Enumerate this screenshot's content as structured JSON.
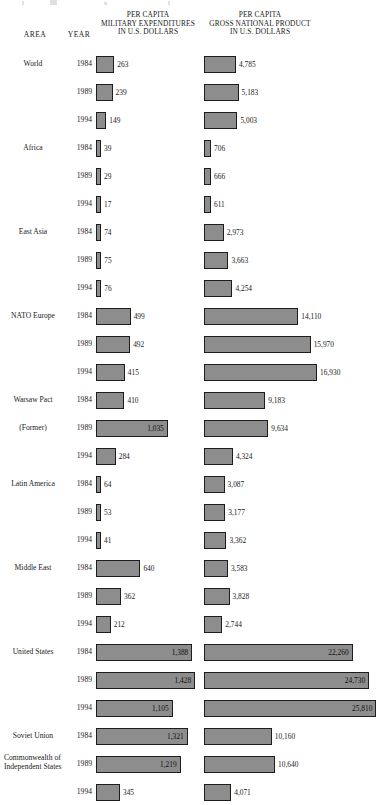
{
  "header": {
    "area": "AREA",
    "year": "YEAR",
    "military": [
      "PER CAPITA",
      "MILITARY EXPENDITURES",
      "IN U.S. DOLLARS"
    ],
    "gnp": [
      "PER CAPITA",
      "GROSS NATIONAL PRODUCT",
      "IN U.S. DOLLARS"
    ]
  },
  "chart_data": {
    "type": "bar",
    "title": "",
    "xlabel": "",
    "ylabel": "",
    "orientation": "horizontal",
    "grid": false,
    "legend": "none",
    "series": [
      {
        "name": "PER CAPITA MILITARY EXPENDITURES IN U.S. DOLLARS",
        "axis_max": 1500,
        "values": [
          263,
          239,
          149,
          39,
          29,
          17,
          74,
          75,
          76,
          499,
          492,
          415,
          410,
          1035,
          284,
          64,
          53,
          41,
          640,
          362,
          212,
          1388,
          1428,
          1105,
          1321,
          1219,
          345
        ],
        "labels": [
          "263",
          "239",
          "149",
          "39",
          "29",
          "17",
          "74",
          "75",
          "76",
          "499",
          "492",
          "415",
          "410",
          "1,035",
          "284",
          "64",
          "53",
          "41",
          "640",
          "362",
          "212",
          "1,388",
          "1,428",
          "1,105",
          "1,321",
          "1,219",
          "345"
        ]
      },
      {
        "name": "PER CAPITA GROSS NATIONAL PRODUCT IN U.S. DOLLARS",
        "axis_max": 26500,
        "values": [
          4785,
          5183,
          5003,
          706,
          666,
          611,
          2973,
          3663,
          4254,
          14110,
          15970,
          16930,
          9183,
          9634,
          4324,
          3087,
          3177,
          3362,
          3583,
          3828,
          2744,
          22260,
          24730,
          25810,
          10160,
          10640,
          4071
        ],
        "labels": [
          "4,785",
          "5,183",
          "5,003",
          "706",
          "666",
          "611",
          "2,973",
          "3,663",
          "4,254",
          "14,110",
          "15,970",
          "16,930",
          "9,183",
          "9,634",
          "4,324",
          "3,087",
          "3,177",
          "3,362",
          "3,583",
          "3,828",
          "2,744",
          "22,260",
          "24,730",
          "25,810",
          "10,160",
          "10,640",
          "4,071"
        ]
      }
    ],
    "categories": [
      "World 1984",
      "World 1989",
      "World 1994",
      "Africa 1984",
      "Africa 1989",
      "Africa 1994",
      "East Asia 1984",
      "East Asia 1989",
      "East Asia 1994",
      "NATO Europe 1984",
      "NATO Europe 1989",
      "NATO Europe 1994",
      "Warsaw Pact (Former) 1984",
      "Warsaw Pact (Former) 1989",
      "Warsaw Pact (Former) 1994",
      "Latin America 1984",
      "Latin America 1989",
      "Latin America 1994",
      "Middle East 1984",
      "Middle East 1989",
      "Middle East 1994",
      "United States 1984",
      "United States 1989",
      "United States 1994",
      "Soviet Union 1984",
      "Commonwealth of Independent States 1989",
      "Commonwealth of Independent States 1994"
    ]
  },
  "rows": [
    {
      "area": "World",
      "area_multiline": false,
      "year": "1984",
      "mil": 263,
      "mil_label": "263",
      "mil_inside": false,
      "gnp": 4785,
      "gnp_label": "4,785",
      "gnp_inside": false
    },
    {
      "area": "",
      "area_multiline": false,
      "year": "1989",
      "mil": 239,
      "mil_label": "239",
      "mil_inside": false,
      "gnp": 5183,
      "gnp_label": "5,183",
      "gnp_inside": false
    },
    {
      "area": "",
      "area_multiline": false,
      "year": "1994",
      "mil": 149,
      "mil_label": "149",
      "mil_inside": false,
      "gnp": 5003,
      "gnp_label": "5,003",
      "gnp_inside": false
    },
    {
      "area": "Africa",
      "area_multiline": false,
      "year": "1984",
      "mil": 39,
      "mil_label": "39",
      "mil_inside": false,
      "gnp": 706,
      "gnp_label": "706",
      "gnp_inside": false
    },
    {
      "area": "",
      "area_multiline": false,
      "year": "1989",
      "mil": 29,
      "mil_label": "29",
      "mil_inside": false,
      "gnp": 666,
      "gnp_label": "666",
      "gnp_inside": false
    },
    {
      "area": "",
      "area_multiline": false,
      "year": "1994",
      "mil": 17,
      "mil_label": "17",
      "mil_inside": false,
      "gnp": 611,
      "gnp_label": "611",
      "gnp_inside": false
    },
    {
      "area": "East Asia",
      "area_multiline": false,
      "year": "1984",
      "mil": 74,
      "mil_label": "74",
      "mil_inside": false,
      "gnp": 2973,
      "gnp_label": "2,973",
      "gnp_inside": false
    },
    {
      "area": "",
      "area_multiline": false,
      "year": "1989",
      "mil": 75,
      "mil_label": "75",
      "mil_inside": false,
      "gnp": 3663,
      "gnp_label": "3,663",
      "gnp_inside": false
    },
    {
      "area": "",
      "area_multiline": false,
      "year": "1994",
      "mil": 76,
      "mil_label": "76",
      "mil_inside": false,
      "gnp": 4254,
      "gnp_label": "4,254",
      "gnp_inside": false
    },
    {
      "area": "NATO Europe",
      "area_multiline": false,
      "year": "1984",
      "mil": 499,
      "mil_label": "499",
      "mil_inside": false,
      "gnp": 14110,
      "gnp_label": "14,110",
      "gnp_inside": false
    },
    {
      "area": "",
      "area_multiline": false,
      "year": "1989",
      "mil": 492,
      "mil_label": "492",
      "mil_inside": false,
      "gnp": 15970,
      "gnp_label": "15,970",
      "gnp_inside": false
    },
    {
      "area": "",
      "area_multiline": false,
      "year": "1994",
      "mil": 415,
      "mil_label": "415",
      "mil_inside": false,
      "gnp": 16930,
      "gnp_label": "16,930",
      "gnp_inside": false
    },
    {
      "area": "Warsaw Pact",
      "area_multiline": false,
      "year": "1984",
      "mil": 410,
      "mil_label": "410",
      "mil_inside": false,
      "gnp": 9183,
      "gnp_label": "9,183",
      "gnp_inside": false
    },
    {
      "area": "(Former)",
      "area_multiline": false,
      "year": "1989",
      "mil": 1035,
      "mil_label": "1,035",
      "mil_inside": true,
      "gnp": 9634,
      "gnp_label": "9,634",
      "gnp_inside": false
    },
    {
      "area": "",
      "area_multiline": false,
      "year": "1994",
      "mil": 284,
      "mil_label": "284",
      "mil_inside": false,
      "gnp": 4324,
      "gnp_label": "4,324",
      "gnp_inside": false
    },
    {
      "area": "Latin America",
      "area_multiline": false,
      "year": "1984",
      "mil": 64,
      "mil_label": "64",
      "mil_inside": false,
      "gnp": 3087,
      "gnp_label": "3,087",
      "gnp_inside": false
    },
    {
      "area": "",
      "area_multiline": false,
      "year": "1989",
      "mil": 53,
      "mil_label": "53",
      "mil_inside": false,
      "gnp": 3177,
      "gnp_label": "3,177",
      "gnp_inside": false
    },
    {
      "area": "",
      "area_multiline": false,
      "year": "1994",
      "mil": 41,
      "mil_label": "41",
      "mil_inside": false,
      "gnp": 3362,
      "gnp_label": "3,362",
      "gnp_inside": false
    },
    {
      "area": "Middle East",
      "area_multiline": false,
      "year": "1984",
      "mil": 640,
      "mil_label": "640",
      "mil_inside": false,
      "gnp": 3583,
      "gnp_label": "3,583",
      "gnp_inside": false
    },
    {
      "area": "",
      "area_multiline": false,
      "year": "1989",
      "mil": 362,
      "mil_label": "362",
      "mil_inside": false,
      "gnp": 3828,
      "gnp_label": "3,828",
      "gnp_inside": false
    },
    {
      "area": "",
      "area_multiline": false,
      "year": "1994",
      "mil": 212,
      "mil_label": "212",
      "mil_inside": false,
      "gnp": 2744,
      "gnp_label": "2,744",
      "gnp_inside": false
    },
    {
      "area": "United States",
      "area_multiline": false,
      "year": "1984",
      "mil": 1388,
      "mil_label": "1,388",
      "mil_inside": true,
      "gnp": 22260,
      "gnp_label": "22,260",
      "gnp_inside": true
    },
    {
      "area": "",
      "area_multiline": false,
      "year": "1989",
      "mil": 1428,
      "mil_label": "1,428",
      "mil_inside": true,
      "gnp": 24730,
      "gnp_label": "24,730",
      "gnp_inside": true
    },
    {
      "area": "",
      "area_multiline": false,
      "year": "1994",
      "mil": 1105,
      "mil_label": "1,105",
      "mil_inside": true,
      "gnp": 25810,
      "gnp_label": "25,810",
      "gnp_inside": true
    },
    {
      "area": "Soviet Union",
      "area_multiline": false,
      "year": "1984",
      "mil": 1321,
      "mil_label": "1,321",
      "mil_inside": true,
      "gnp": 10160,
      "gnp_label": "10,160",
      "gnp_inside": false
    },
    {
      "area": "Commonwealth of Independent States",
      "area_multiline": true,
      "year": "1989",
      "mil": 1219,
      "mil_label": "1,219",
      "mil_inside": true,
      "gnp": 10640,
      "gnp_label": "10,640",
      "gnp_inside": false
    },
    {
      "area": "",
      "area_multiline": false,
      "year": "1994",
      "mil": 345,
      "mil_label": "345",
      "mil_inside": false,
      "gnp": 4071,
      "gnp_label": "4,071",
      "gnp_inside": false
    }
  ],
  "scale": {
    "mil_px_per_unit": 0.0694,
    "gnp_px_per_unit": 0.00668,
    "mil_min_px": 5,
    "gnp_min_px": 7,
    "row_pitch": 28,
    "first_row_top": 52
  },
  "colors": {
    "bar_fill": "#8d8d8d",
    "bar_border": "#1d1d1d",
    "text": "#1a1a1a",
    "background": "#ffffff"
  }
}
